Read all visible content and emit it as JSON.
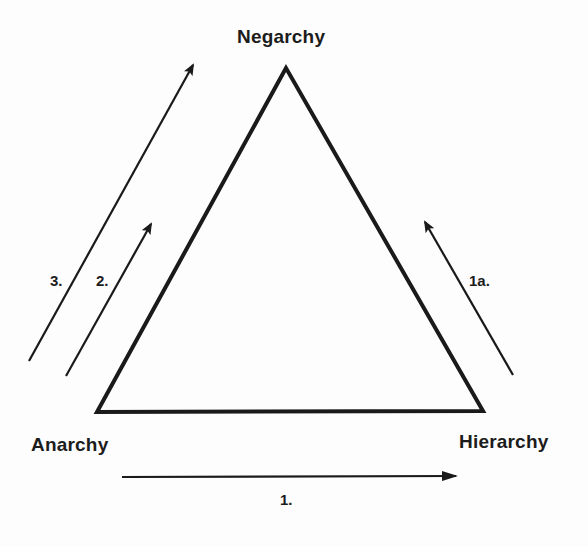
{
  "diagram": {
    "type": "triangle-transition-diagram",
    "vertices": {
      "top": {
        "label": "Negarchy"
      },
      "bottom_left": {
        "label": "Anarchy"
      },
      "bottom_right": {
        "label": "Hierarchy"
      }
    },
    "arrows": [
      {
        "id": "arrow-1",
        "label": "1.",
        "from": "Anarchy",
        "to": "Hierarchy",
        "direction": "right"
      },
      {
        "id": "arrow-1a",
        "label": "1a.",
        "from": "Hierarchy",
        "to": "Negarchy",
        "direction": "up-left"
      },
      {
        "id": "arrow-2",
        "label": "2.",
        "from": "Anarchy",
        "to": "Negarchy",
        "direction": "up-right",
        "length": "short"
      },
      {
        "id": "arrow-3",
        "label": "3.",
        "from": "Anarchy",
        "to": "Negarchy",
        "direction": "up-right",
        "length": "long"
      }
    ],
    "colors": {
      "background": "#fdfdfd",
      "stroke": "#1a1a1a",
      "text": "#1c1c1c"
    }
  }
}
